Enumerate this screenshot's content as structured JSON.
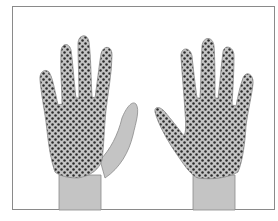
{
  "figure": {
    "colors": {
      "skin": "#c4c4c4",
      "dots": "#2a2a2a",
      "outline": "#8a8a8a",
      "frame": "#8a8a8a",
      "background": "#ffffff"
    },
    "hands": [
      {
        "id": "left-hand",
        "pattern_area": "fingers and back of hand",
        "thumb_patterned": false
      },
      {
        "id": "right-hand",
        "pattern_area": "fingers, thumb and back of hand",
        "thumb_patterned": true
      }
    ]
  }
}
